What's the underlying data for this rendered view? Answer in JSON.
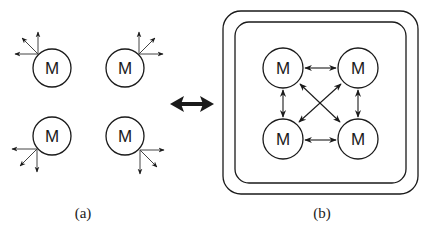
{
  "figure": {
    "panel_a": {
      "caption": "(a)",
      "nodes": [
        {
          "label": "M",
          "position": "top-left",
          "arrows_direction": "up-left"
        },
        {
          "label": "M",
          "position": "top-right",
          "arrows_direction": "up-right"
        },
        {
          "label": "M",
          "position": "bottom-left",
          "arrows_direction": "down-left"
        },
        {
          "label": "M",
          "position": "bottom-right",
          "arrows_direction": "down-right"
        }
      ]
    },
    "transition_arrow": "bidirectional",
    "panel_b": {
      "caption": "(b)",
      "enclosure": "double rounded rectangle",
      "nodes": [
        {
          "label": "M",
          "position": "top-left"
        },
        {
          "label": "M",
          "position": "top-right"
        },
        {
          "label": "M",
          "position": "bottom-left"
        },
        {
          "label": "M",
          "position": "bottom-right"
        }
      ],
      "connections": [
        {
          "from": "top-left",
          "to": "top-right",
          "type": "bidirectional"
        },
        {
          "from": "bottom-left",
          "to": "bottom-right",
          "type": "bidirectional"
        },
        {
          "from": "top-left",
          "to": "bottom-left",
          "type": "bidirectional"
        },
        {
          "from": "top-right",
          "to": "bottom-right",
          "type": "bidirectional"
        },
        {
          "from": "top-left",
          "to": "bottom-right",
          "type": "bidirectional"
        },
        {
          "from": "top-right",
          "to": "bottom-left",
          "type": "bidirectional"
        }
      ]
    }
  }
}
